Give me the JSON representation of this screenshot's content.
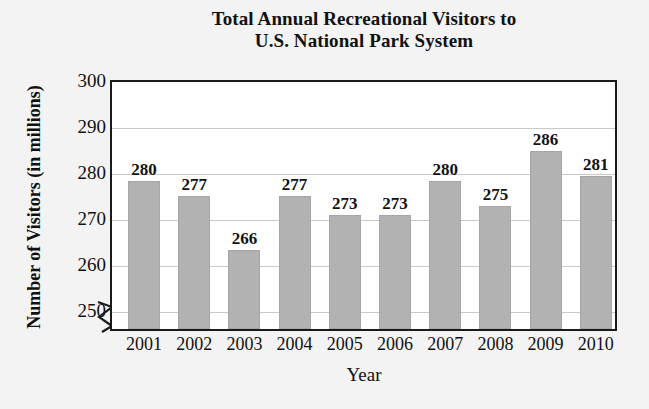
{
  "chart_data": {
    "type": "bar",
    "title": "Total Annual Recreational Visitors to U.S. National Park System",
    "title_line1": "Total Annual Recreational Visitors to",
    "title_line2": "U.S. National Park System",
    "xlabel": "Year",
    "ylabel": "Number of Visitors (in millions)",
    "categories": [
      "2001",
      "2002",
      "2003",
      "2004",
      "2005",
      "2006",
      "2007",
      "2008",
      "2009",
      "2010"
    ],
    "values": [
      280,
      277,
      266,
      277,
      273,
      273,
      280,
      275,
      286,
      281
    ],
    "data_labels": [
      "280",
      "277",
      "266",
      "277",
      "273",
      "273",
      "280",
      "275",
      "286",
      "281"
    ],
    "ylim": [
      250,
      300
    ],
    "y_ticks": [
      250,
      260,
      270,
      280,
      290,
      300
    ],
    "y_tick_labels": [
      "250",
      "260",
      "270",
      "280",
      "290",
      "300"
    ],
    "grid": true,
    "grid_axis": "y",
    "legend": null,
    "axis_break": true,
    "axis_break_note": "zigzag break on y-axis below 250",
    "bar_color": "#b2b2b2",
    "bar_edge_color": "#a6a6a6",
    "plot_background": "#ffffff",
    "page_background": "#f3f3f3",
    "axis_color": "#1a1a1a",
    "gridline_color": "#c9c9c9",
    "text_color": "#111111"
  }
}
